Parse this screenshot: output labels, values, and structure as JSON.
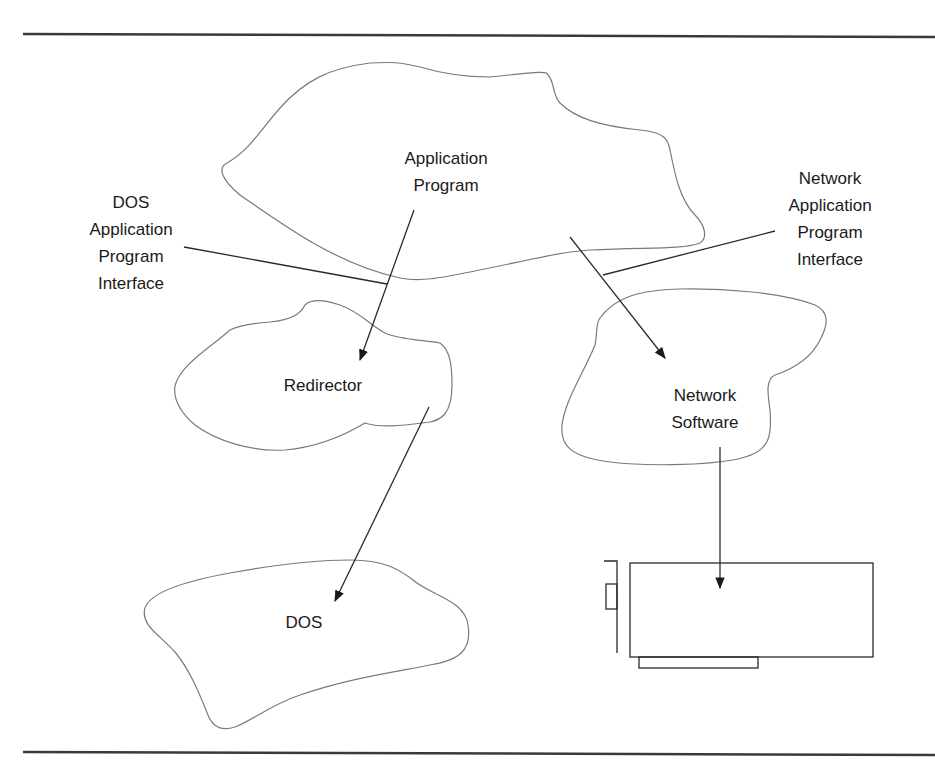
{
  "diagram": {
    "type": "architecture",
    "nodes": {
      "application_program": {
        "lines": [
          "Application",
          "Program"
        ]
      },
      "redirector": {
        "lines": [
          "Redirector"
        ]
      },
      "network_software": {
        "lines": [
          "Network",
          "Software"
        ]
      },
      "dos": {
        "lines": [
          "DOS"
        ]
      },
      "network_card": {
        "lines": []
      }
    },
    "annotations": {
      "dos_api": {
        "lines": [
          "DOS",
          "Application",
          "Program",
          "Interface"
        ]
      },
      "network_api": {
        "lines": [
          "Network",
          "Application",
          "Program",
          "Interface"
        ]
      }
    },
    "edges": [
      {
        "from": "Application Program",
        "to": "Redirector",
        "via": "DOS Application Program Interface"
      },
      {
        "from": "Application Program",
        "to": "Network Software",
        "via": "Network Application Program Interface"
      },
      {
        "from": "Redirector",
        "to": "DOS"
      },
      {
        "from": "Network Software",
        "to": "Network Card"
      }
    ],
    "colors": {
      "outline": "#7a7a7a",
      "line": "#2a2a2a",
      "rule": "#3a3a3a",
      "text": "#1a1a1a"
    }
  }
}
